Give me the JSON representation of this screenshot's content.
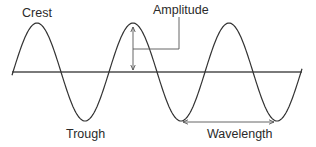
{
  "diagram": {
    "type": "transverse-wave",
    "labels": {
      "crest": "Crest",
      "amplitude": "Amplitude",
      "trough": "Trough",
      "wavelength": "Wavelength"
    },
    "colors": {
      "wave": "#333333",
      "axis": "#7a7a7a",
      "annotation": "#555555",
      "text": "#2a2a2a"
    },
    "geometry": {
      "axis_y": 72,
      "axis_x_start": 12,
      "axis_x_end": 302,
      "wave_amplitude_px": 49,
      "wave_period_px": 96,
      "wave_start_x": 12,
      "wave_end_x": 302,
      "crest_x": [
        37,
        133,
        228
      ],
      "trough_x": [
        85,
        181,
        276
      ]
    }
  }
}
